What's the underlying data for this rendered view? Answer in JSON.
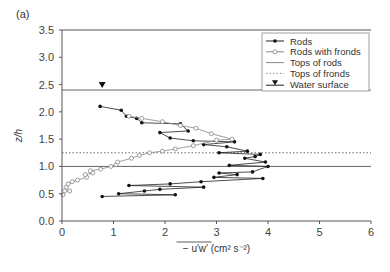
{
  "panel_label": "(a)",
  "chart_data": {
    "type": "line",
    "title": "",
    "xlabel": "− u′w′ (cm² s⁻²)",
    "ylabel": "z/h",
    "xlim": [
      0,
      6
    ],
    "ylim": [
      0,
      3.5
    ],
    "xticks": [
      "0",
      "1",
      "2",
      "3",
      "4",
      "5",
      "6"
    ],
    "yticks": [
      "0.0",
      "0.5",
      "1.0",
      "1.5",
      "2.0",
      "2.5",
      "3.0",
      "3.5"
    ],
    "grid": false,
    "legend_position": "upper right",
    "legend": [
      "Rods",
      "Rods with fronds",
      "Tops of rods",
      "Tops of fronds",
      "Water surface"
    ],
    "series": [
      {
        "name": "Rods",
        "marker": "filled-circle",
        "points": [
          [
            0.74,
            2.1
          ],
          [
            1.15,
            2.03
          ],
          [
            1.25,
            1.92
          ],
          [
            1.45,
            1.88
          ],
          [
            1.55,
            1.8
          ],
          [
            2.3,
            1.78
          ],
          [
            2.45,
            1.65
          ],
          [
            1.9,
            1.62
          ],
          [
            2.1,
            1.52
          ],
          [
            2.55,
            1.47
          ],
          [
            3.35,
            1.45
          ],
          [
            2.75,
            1.4
          ],
          [
            3.2,
            1.36
          ],
          [
            3.6,
            1.28
          ],
          [
            3.05,
            1.25
          ],
          [
            3.85,
            1.22
          ],
          [
            3.75,
            1.18
          ],
          [
            3.55,
            1.15
          ],
          [
            3.95,
            1.08
          ],
          [
            3.25,
            1.02
          ],
          [
            4.0,
            1.0
          ],
          [
            3.7,
            0.9
          ],
          [
            3.05,
            0.88
          ],
          [
            3.4,
            0.85
          ],
          [
            2.95,
            0.8
          ],
          [
            3.9,
            0.78
          ],
          [
            2.7,
            0.72
          ],
          [
            2.1,
            0.68
          ],
          [
            1.3,
            0.65
          ],
          [
            2.75,
            0.62
          ],
          [
            1.9,
            0.58
          ],
          [
            1.6,
            0.55
          ],
          [
            1.1,
            0.5
          ],
          [
            2.2,
            0.48
          ],
          [
            0.78,
            0.45
          ]
        ]
      },
      {
        "name": "Rods with fronds",
        "marker": "open-circle",
        "points": [
          [
            0.02,
            0.48
          ],
          [
            0.05,
            0.55
          ],
          [
            0.15,
            0.55
          ],
          [
            0.08,
            0.62
          ],
          [
            0.12,
            0.68
          ],
          [
            0.2,
            0.72
          ],
          [
            0.3,
            0.75
          ],
          [
            0.48,
            0.8
          ],
          [
            0.45,
            0.85
          ],
          [
            0.6,
            0.88
          ],
          [
            0.55,
            0.92
          ],
          [
            0.75,
            0.95
          ],
          [
            0.95,
            1.0
          ],
          [
            1.05,
            1.03
          ],
          [
            1.08,
            1.08
          ],
          [
            1.35,
            1.15
          ],
          [
            1.5,
            1.2
          ],
          [
            1.7,
            1.25
          ],
          [
            1.95,
            1.28
          ],
          [
            2.2,
            1.32
          ],
          [
            2.55,
            1.38
          ],
          [
            3.0,
            1.48
          ],
          [
            3.3,
            1.5
          ],
          [
            2.9,
            1.6
          ],
          [
            2.6,
            1.7
          ],
          [
            2.3,
            1.75
          ],
          [
            1.95,
            1.82
          ],
          [
            1.55,
            1.88
          ],
          [
            1.3,
            1.92
          ]
        ]
      }
    ],
    "reference_lines": [
      {
        "name": "Tops of rods",
        "y": 1.0,
        "style": "solid"
      },
      {
        "name": "Tops of fronds",
        "y": 1.25,
        "style": "dotted"
      },
      {
        "name": "Water surface",
        "y": 2.4,
        "style": "solid",
        "marker": "filled-triangle-down",
        "marker_x": 0.78
      }
    ]
  },
  "colors": {
    "axis": "#555555",
    "rods": "#222222",
    "fronds": "#888888",
    "reference": "#666666"
  }
}
